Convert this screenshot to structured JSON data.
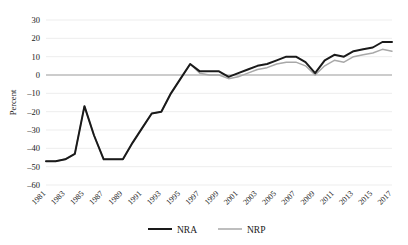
{
  "chart_data": {
    "type": "line",
    "title": "",
    "xlabel": "",
    "ylabel": "Percent",
    "ylim": [
      -60,
      30
    ],
    "ytick_step": 10,
    "yticks": [
      30,
      20,
      10,
      0,
      -10,
      -20,
      -30,
      -40,
      -50,
      -60
    ],
    "ytick_labels": [
      "30",
      "20",
      "10",
      "0",
      "–10",
      "–20",
      "–30",
      "–40",
      "–50",
      "–60"
    ],
    "xlim": [
      1981,
      2017
    ],
    "x": [
      1981,
      1982,
      1983,
      1984,
      1985,
      1986,
      1987,
      1988,
      1989,
      1990,
      1991,
      1992,
      1993,
      1994,
      1995,
      1996,
      1997,
      1998,
      1999,
      2000,
      2001,
      2002,
      2003,
      2004,
      2005,
      2006,
      2007,
      2008,
      2009,
      2010,
      2011,
      2012,
      2013,
      2014,
      2015,
      2016,
      2017
    ],
    "xticks": [
      1981,
      1983,
      1985,
      1987,
      1989,
      1991,
      1993,
      1995,
      1997,
      1999,
      2001,
      2003,
      2005,
      2007,
      2009,
      2011,
      2013,
      2015,
      2017
    ],
    "xtick_labels": [
      "1981",
      "1983",
      "1985",
      "1987",
      "1989",
      "1991",
      "1993",
      "1995",
      "1997",
      "1999",
      "2001",
      "2003",
      "2005",
      "2007",
      "2009",
      "2011",
      "2013",
      "2015",
      "2017"
    ],
    "xtick_rotation": -45,
    "grid": "horizontal",
    "legend_position": "bottom",
    "series": [
      {
        "name": "NRA",
        "color": "#1a1a1a",
        "width": 2.0,
        "values": [
          -47,
          -47,
          -46,
          -43,
          -17,
          -33,
          -46,
          -46,
          -46,
          -37,
          -29,
          -21,
          -20,
          -10,
          -2,
          6,
          2,
          2,
          2,
          -1,
          1,
          3,
          5,
          6,
          8,
          10,
          10,
          7,
          1,
          8,
          11,
          10,
          13,
          14,
          15,
          18,
          18
        ]
      },
      {
        "name": "NRP",
        "color": "#a8a8a8",
        "width": 1.5,
        "values": [
          -47,
          -47,
          -46,
          -43,
          -17,
          -33,
          -46,
          -46,
          -46,
          -37,
          -29,
          -21,
          -20,
          -10,
          -2,
          6,
          1,
          0,
          0,
          -2,
          -1,
          1,
          3,
          4,
          6,
          7,
          7,
          5,
          0,
          5,
          8,
          7,
          10,
          11,
          12,
          14,
          13
        ]
      }
    ]
  },
  "legend": {
    "items": [
      {
        "label": "NRA",
        "color": "#1a1a1a",
        "width": 2.0
      },
      {
        "label": "NRP",
        "color": "#a8a8a8",
        "width": 1.5
      }
    ]
  }
}
